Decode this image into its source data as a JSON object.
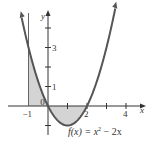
{
  "chart_data": {
    "type": "line",
    "title": "",
    "function": "f(x) = x^2 - 2x",
    "function_label": {
      "f": "f(x) = x",
      "exp": "2",
      "rest": " − 2x"
    },
    "xlabel": "x",
    "ylabel": "y",
    "x_ticks": [
      -1,
      1,
      2,
      3,
      4
    ],
    "x_tick_labels": [
      "−1",
      "0",
      "2",
      "4"
    ],
    "y_ticks": [
      -1,
      1,
      2,
      3,
      4
    ],
    "y_tick_labels": [
      "1",
      "3"
    ],
    "xlim": [
      -1.5,
      4.8
    ],
    "ylim": [
      -1.5,
      5
    ],
    "x": [
      -1.35,
      -1,
      -0.5,
      0,
      0.5,
      1,
      1.5,
      2,
      2.5,
      3,
      3.45
    ],
    "y": [
      4.52,
      3,
      1.25,
      0,
      -0.75,
      -1,
      -0.75,
      0,
      1.25,
      3,
      5.0
    ],
    "shaded_regions": [
      {
        "from": -1,
        "to": 0,
        "description": "area between curve and x-axis, above axis"
      },
      {
        "from": 0,
        "to": 2,
        "description": "area between curve and x-axis, below axis"
      }
    ],
    "colors": {
      "curve": "#555555",
      "shade": "#d4d4d4",
      "axis": "#333333"
    }
  }
}
